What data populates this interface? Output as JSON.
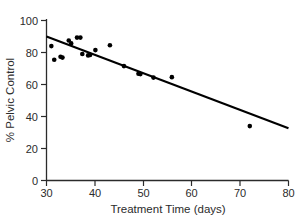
{
  "chart_data": {
    "type": "scatter",
    "title": "",
    "xlabel": "Treatment Time (days)",
    "ylabel": "% Pelvic Control",
    "xlim": [
      30,
      80
    ],
    "ylim": [
      0,
      100
    ],
    "xticks": [
      30,
      40,
      50,
      60,
      70,
      80
    ],
    "yticks": [
      0,
      20,
      40,
      60,
      80,
      100
    ],
    "grid": false,
    "legend": null,
    "marker": "filled-circle",
    "marker_color": "#000000",
    "line_color": "#000000",
    "points": [
      {
        "x": 31.0,
        "y": 84.0
      },
      {
        "x": 31.6,
        "y": 75.5
      },
      {
        "x": 32.9,
        "y": 77.3
      },
      {
        "x": 33.3,
        "y": 76.8
      },
      {
        "x": 34.6,
        "y": 87.5
      },
      {
        "x": 35.1,
        "y": 85.7
      },
      {
        "x": 36.3,
        "y": 89.3
      },
      {
        "x": 37.0,
        "y": 89.3
      },
      {
        "x": 37.4,
        "y": 79.1
      },
      {
        "x": 38.6,
        "y": 78.2
      },
      {
        "x": 39.0,
        "y": 78.5
      },
      {
        "x": 40.1,
        "y": 81.5
      },
      {
        "x": 43.1,
        "y": 84.5
      },
      {
        "x": 46.0,
        "y": 71.5
      },
      {
        "x": 49.0,
        "y": 66.7
      },
      {
        "x": 49.4,
        "y": 66.5
      },
      {
        "x": 52.1,
        "y": 64.3
      },
      {
        "x": 55.9,
        "y": 64.6
      },
      {
        "x": 72.0,
        "y": 34.0
      }
    ],
    "fit_line": {
      "label": "linear regression",
      "x_start": 30.0,
      "y_start": 90.0,
      "x_end": 80.0,
      "y_end": 32.6
    }
  },
  "axes": {
    "x_tick_labels": [
      "30",
      "40",
      "50",
      "60",
      "70",
      "80"
    ],
    "y_tick_labels": [
      "0",
      "20",
      "40",
      "60",
      "80",
      "100"
    ],
    "x_title": "Treatment Time (days)",
    "y_title": "% Pelvic Control"
  }
}
